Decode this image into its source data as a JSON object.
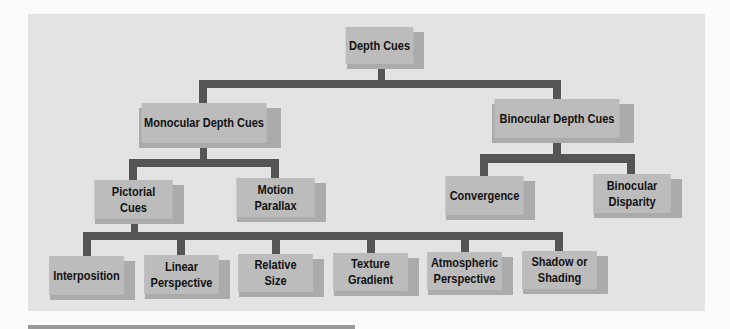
{
  "diagram": {
    "type": "tree",
    "colors": {
      "page_background": "#fbfbfb",
      "panel_background": "#e3e3e3",
      "node_fill": "#bcbcbc",
      "node_shadow": "#ababab",
      "connector": "#555555",
      "text": "#111111"
    },
    "nodes": {
      "root": {
        "label": "Depth Cues"
      },
      "monocular": {
        "label": "Monocular Depth Cues"
      },
      "binocular": {
        "label": "Binocular Depth Cues"
      },
      "pictorial": {
        "label": "Pictorial\nCues"
      },
      "motion_parallax": {
        "label": "Motion\nParallax"
      },
      "convergence": {
        "label": "Convergence"
      },
      "binocular_disparity": {
        "label": "Binocular\nDisparity"
      },
      "interposition": {
        "label": "Interposition"
      },
      "linear_perspective": {
        "label": "Linear\nPerspective"
      },
      "relative_size": {
        "label": "Relative\nSize"
      },
      "texture_gradient": {
        "label": "Texture\nGradient"
      },
      "atmospheric_perspective": {
        "label": "Atmospheric\nPerspective"
      },
      "shadow_or_shading": {
        "label": "Shadow or\nShading"
      }
    },
    "edges": [
      [
        "root",
        "monocular"
      ],
      [
        "root",
        "binocular"
      ],
      [
        "monocular",
        "pictorial"
      ],
      [
        "monocular",
        "motion_parallax"
      ],
      [
        "binocular",
        "convergence"
      ],
      [
        "binocular",
        "binocular_disparity"
      ],
      [
        "pictorial",
        "interposition"
      ],
      [
        "pictorial",
        "linear_perspective"
      ],
      [
        "pictorial",
        "relative_size"
      ],
      [
        "pictorial",
        "texture_gradient"
      ],
      [
        "pictorial",
        "atmospheric_perspective"
      ],
      [
        "pictorial",
        "shadow_or_shading"
      ]
    ]
  }
}
